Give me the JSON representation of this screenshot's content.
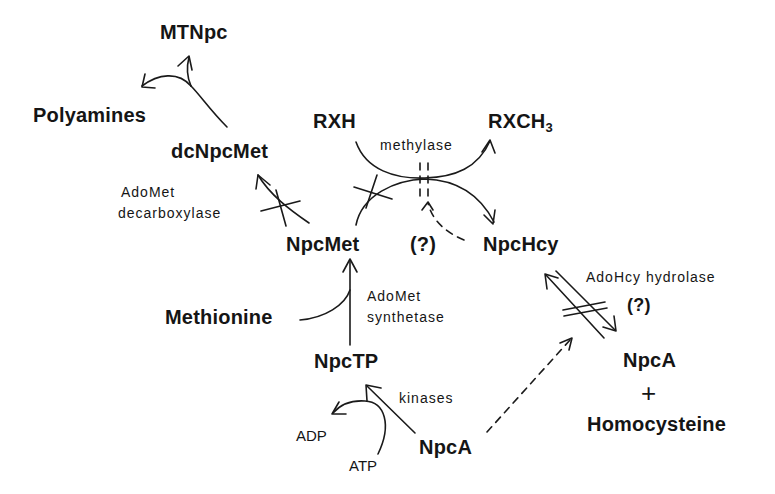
{
  "diagram": {
    "nodes": {
      "mtnpc": "MTNpc",
      "polyamines": "Polyamines",
      "dcnpcmet": "dcNpcMet",
      "rxh": "RXH",
      "rxch3_main": "RXCH",
      "rxch3_sub": "3",
      "npcmet": "NpcMet",
      "question_mid": "(?)",
      "npchcy": "NpcHcy",
      "methionine": "Methionine",
      "npctp": "NpcTP",
      "npca_bottom": "NpcA",
      "adp": "ADP",
      "atp": "ATP",
      "npca_right": "NpcA",
      "plus": "+",
      "homocysteine": "Homocysteine"
    },
    "enzymes": {
      "methylase": "methylase",
      "adomet_decarboxylase_line1": "AdoMet",
      "adomet_decarboxylase_line2": "decarboxylase",
      "adomet_synthetase_line1": "AdoMet",
      "adomet_synthetase_line2": "synthetase",
      "kinases": "kinases",
      "adohcy_hydrolase": "AdoHcy hydrolase",
      "question_right": "(?)"
    },
    "edges": [
      {
        "from": "dcNpcMet",
        "to": "MTNpc",
        "type": "arrow"
      },
      {
        "from": "dcNpcMet",
        "to": "Polyamines",
        "type": "arrow"
      },
      {
        "from": "NpcMet",
        "to": "dcNpcMet",
        "type": "arrow",
        "enzyme": "AdoMet decarboxylase",
        "inhibited": true
      },
      {
        "from": "NpcMet",
        "to": "NpcHcy",
        "type": "arrow",
        "enzyme": "methylase",
        "inhibited": true
      },
      {
        "from": "RXH",
        "to": "RXCH3",
        "type": "arrow",
        "enzyme": "methylase"
      },
      {
        "from": "NpcHcy",
        "to": "methylase",
        "type": "dashed-arrow",
        "label": "(?)"
      },
      {
        "from": "NpcTP",
        "to": "NpcMet",
        "type": "arrow",
        "enzyme": "AdoMet synthetase"
      },
      {
        "from": "Methionine",
        "to": "NpcMet",
        "type": "arrow"
      },
      {
        "from": "NpcA",
        "to": "NpcTP",
        "type": "arrow",
        "enzyme": "kinases"
      },
      {
        "from": "ATP",
        "to": "ADP",
        "type": "arrow"
      },
      {
        "from": "NpcHcy",
        "to": "NpcA + Homocysteine",
        "type": "reversible",
        "enzyme": "AdoHcy hydrolase",
        "inhibited": true
      },
      {
        "from": "NpcA",
        "to": "AdoHcy hydrolase",
        "type": "dashed-arrow"
      }
    ]
  }
}
